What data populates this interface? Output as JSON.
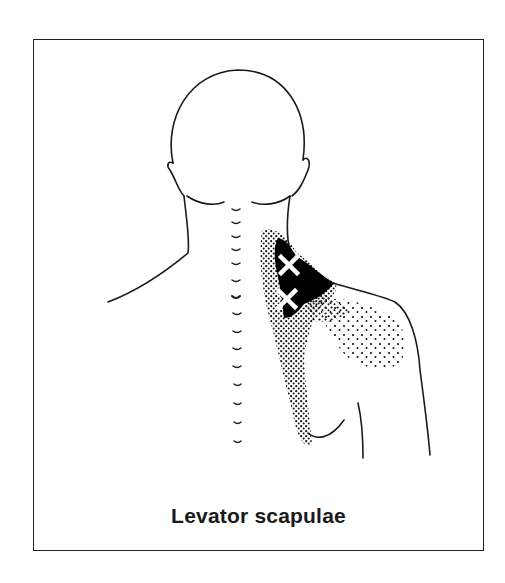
{
  "figure": {
    "caption": "Levator scapulae",
    "trigger_point_markers": [
      {
        "symbol": "×",
        "x": 289,
        "y": 265
      },
      {
        "symbol": "×",
        "x": 287,
        "y": 299
      }
    ],
    "colors": {
      "outline": "#1a1a1a",
      "referred_pain_zone": "#000000",
      "marker": "#ffffff",
      "background": "#ffffff"
    }
  }
}
